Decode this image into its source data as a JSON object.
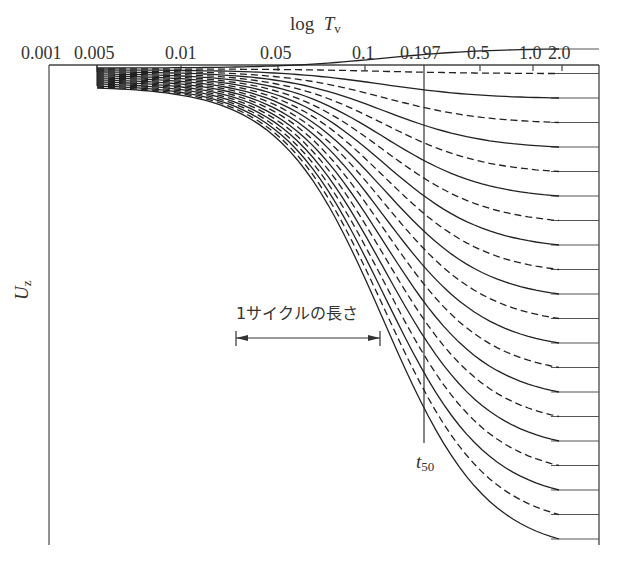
{
  "diagram": {
    "x_axis": {
      "title_prefix": "log",
      "title_var": "T",
      "title_sub": "v",
      "tick_labels": [
        "0.001",
        "0.005",
        "0.01",
        "0.05",
        "0.1",
        "0.197",
        "0.5",
        "1.0",
        "2.0"
      ]
    },
    "y_axis": {
      "title_var": "U",
      "title_sub": "z"
    },
    "marker_line": {
      "label_var": "t",
      "label_sub": "50",
      "x_value": "0.197"
    },
    "cycle_annotation": {
      "label": "1サイクルの長さ"
    },
    "curves": {
      "count": 21,
      "style_pattern": [
        "solid",
        "dashed"
      ],
      "description": "Family of consolidation curves (Uz vs log Tv) for successive depths; alternating solid and dashed lines, each ending at a horizontal tick on the right axis"
    }
  }
}
